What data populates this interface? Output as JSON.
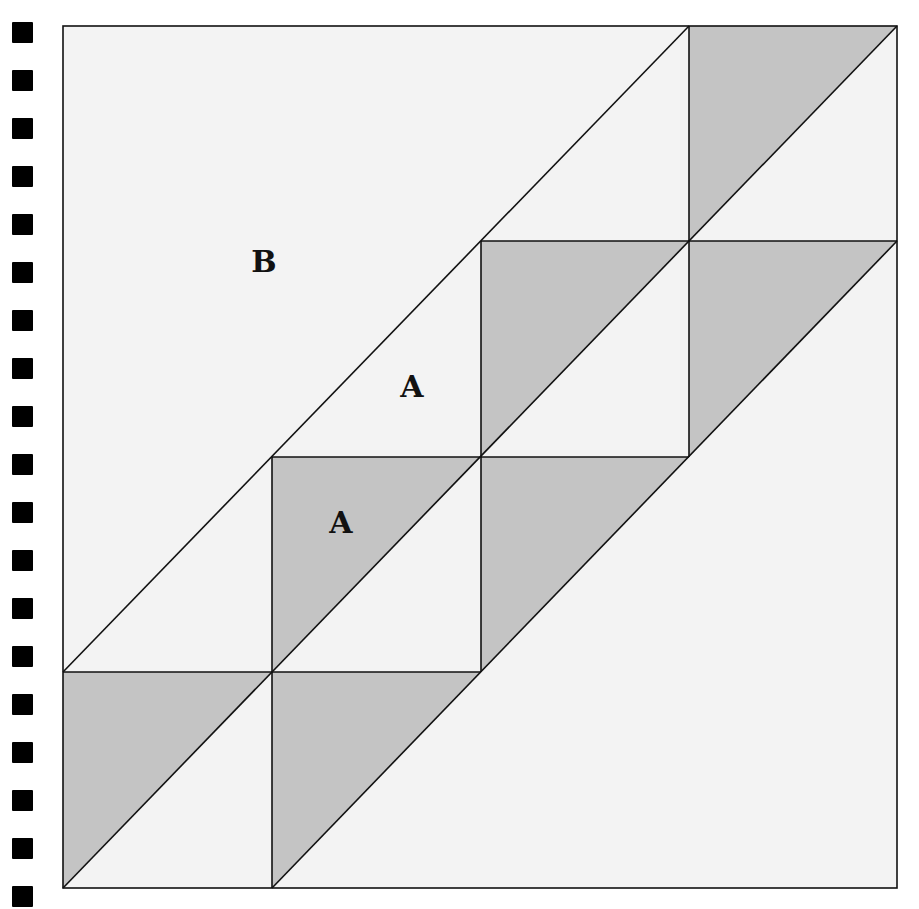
{
  "diagram": {
    "colors": {
      "background": "#f3f3f3",
      "shaded": "#c4c4c4",
      "stroke": "#111111",
      "holes": "#000000"
    },
    "grid": {
      "x": [
        63,
        272,
        481,
        689,
        897
      ],
      "y": [
        26,
        241,
        457,
        672,
        888
      ]
    },
    "labels": [
      {
        "text": "B",
        "x": 264,
        "y": 272
      },
      {
        "text": "A",
        "x": 412,
        "y": 397
      },
      {
        "text": "A",
        "x": 341,
        "y": 533
      }
    ],
    "binding_holes": {
      "count": 19,
      "first_y": 22,
      "spacing": 48
    }
  }
}
